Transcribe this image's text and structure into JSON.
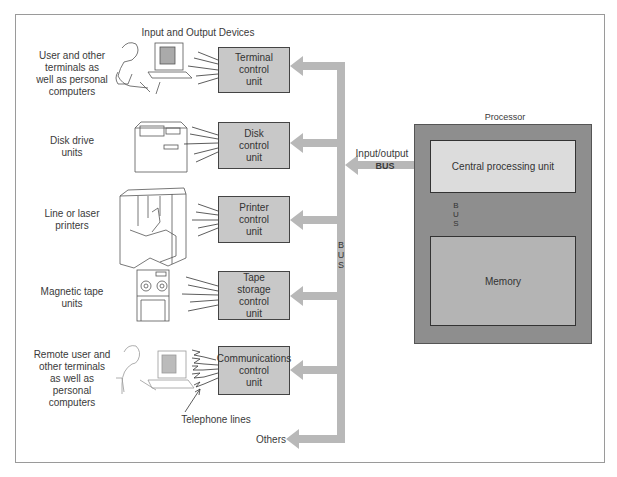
{
  "header": {
    "title": "Input and Output Devices"
  },
  "devices": [
    {
      "label": "User and other\nterminals as\nwell as personal\ncomputers",
      "icon": "terminal-user-icon"
    },
    {
      "label": "Disk drive\nunits",
      "icon": "disk-drive-icon"
    },
    {
      "label": "Line or laser\nprinters",
      "icon": "printer-icon"
    },
    {
      "label": "Magnetic tape\nunits",
      "icon": "tape-drive-icon"
    },
    {
      "label": "Remote user and\nother terminals\nas well as\npersonal\ncomputers",
      "icon": "remote-terminal-icon"
    }
  ],
  "control_units": [
    {
      "label": "Terminal\ncontrol\nunit"
    },
    {
      "label": "Disk\ncontrol\nunit"
    },
    {
      "label": "Printer\ncontrol\nunit"
    },
    {
      "label": "Tape\nstorage\ncontrol\nunit"
    },
    {
      "label": "Communications\ncontrol\nunit"
    }
  ],
  "bus": {
    "vertical_label": "B\nU\nS",
    "io_label": "Input/output",
    "io_bus_label": "BUS",
    "internal_label": "B\nU\nS"
  },
  "telephone_label": "Telephone lines",
  "others_label": "Others",
  "processor": {
    "title": "Processor",
    "cpu_label": "Central processing unit",
    "memory_label": "Memory"
  },
  "colors": {
    "bus": "#b8b8b8",
    "unit": "#c8c8c8",
    "processor": "#8e8e8e",
    "cpu": "#dcdcdc",
    "memory": "#b4b4b4"
  }
}
